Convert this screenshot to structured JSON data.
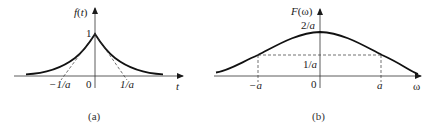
{
  "panel_a": {
    "caption": "(a)",
    "y_axis_label": "f(t)",
    "x_axis_label": "t",
    "peak_label": "1",
    "origin_label": "0",
    "tick_left": "−1/a",
    "tick_right": "1/a",
    "curve": "two-sided exponential decay e^{-a|t|}",
    "tangent_lines": "dashed tangents from peak to ±1/a"
  },
  "panel_b": {
    "caption": "(b)",
    "y_axis_label": "F(ω)",
    "x_axis_label": "ω",
    "peak_label": "2/a",
    "half_label": "1/a",
    "origin_label": "0",
    "tick_left": "−a",
    "tick_right": "a",
    "curve": "Lorentzian 2a/(a²+ω²)",
    "guide_lines": "dashed lines at ±a up to 1/a level"
  },
  "colors": {
    "ink": "#1a1a1a",
    "background": "#ffffff"
  }
}
